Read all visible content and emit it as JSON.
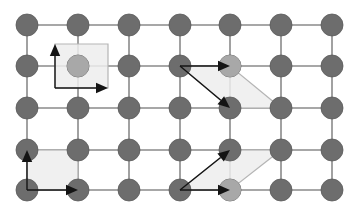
{
  "figure": {
    "width": 358,
    "height": 216,
    "background_color": "#ffffff"
  },
  "style": {
    "node_fill": "#6d6d6d",
    "node_stroke": "#5a5a5a",
    "node_radius": 11,
    "bond_color": "#8a8a8a",
    "bond_width": 1.6,
    "cell_fill": "#ededed",
    "cell_fill_opacity": 0.85,
    "cell_stroke": "#b5b5b5",
    "cell_stroke_width": 1.2,
    "arrow_color": "#141414",
    "arrow_stem_width": 1.4,
    "ghost_node_fill": "#d8d8d8",
    "ghost_node_opacity": 0.55
  },
  "lattice": {
    "columns": 7,
    "rows": 5,
    "column_x": [
      27,
      78,
      129,
      180,
      230,
      281,
      332
    ],
    "row_y": [
      25,
      66,
      108,
      150,
      190
    ],
    "edge_margin": 9,
    "node_count": 35
  },
  "cells": [
    {
      "name": "unit-cell-top-left-square",
      "shape": "square",
      "points": "55,44 108,44 108,88 55,88",
      "ghost_site": {
        "cx": 78,
        "cy": 66
      },
      "vectors": [
        {
          "name": "vector-up",
          "x1": 55,
          "y1": 88,
          "x2": 55,
          "y2": 44,
          "label": "a2"
        },
        {
          "name": "vector-right",
          "x1": 55,
          "y1": 88,
          "x2": 108,
          "y2": 88,
          "label": "a1"
        }
      ]
    },
    {
      "name": "unit-cell-top-right-parallelogram",
      "shape": "parallelogram",
      "points": "180,66 230,66 281,108 230,108",
      "ghost_site": {
        "cx": 230,
        "cy": 66
      },
      "vectors": [
        {
          "name": "vector-right",
          "x1": 180,
          "y1": 66,
          "x2": 230,
          "y2": 66,
          "label": "a1"
        },
        {
          "name": "vector-diagonal-down-right",
          "x1": 180,
          "y1": 66,
          "x2": 230,
          "y2": 108,
          "label": "a2"
        }
      ]
    },
    {
      "name": "unit-cell-bottom-left-square",
      "shape": "square",
      "points": "27,150 78,150 78,190 27,190",
      "ghost_site": null,
      "vectors": [
        {
          "name": "vector-up",
          "x1": 27,
          "y1": 190,
          "x2": 27,
          "y2": 150,
          "label": "a2"
        },
        {
          "name": "vector-right",
          "x1": 27,
          "y1": 190,
          "x2": 78,
          "y2": 190,
          "label": "a1"
        }
      ]
    },
    {
      "name": "unit-cell-bottom-right-parallelogram",
      "shape": "parallelogram",
      "points": "180,190 230,150 281,150 230,190",
      "ghost_site": {
        "cx": 230,
        "cy": 190
      },
      "vectors": [
        {
          "name": "vector-diagonal-up-right",
          "x1": 180,
          "y1": 190,
          "x2": 230,
          "y2": 150,
          "label": "a2"
        },
        {
          "name": "vector-right",
          "x1": 180,
          "y1": 190,
          "x2": 230,
          "y2": 190,
          "label": "a1"
        }
      ]
    }
  ]
}
